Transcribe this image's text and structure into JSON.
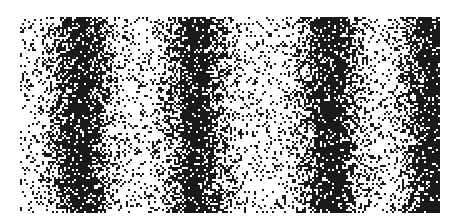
{
  "image": {
    "description": "Dithered stochastic pattern of black dots on white forming vertical dark bands",
    "width": 455,
    "height": 223,
    "background": "#ffffff",
    "dot_color": "#1a1a1a",
    "region": {
      "x0": 20,
      "y0": 17,
      "x1": 440,
      "y1": 212
    },
    "band_centers_x": [
      80,
      195,
      330,
      432
    ],
    "band_sigma": 28,
    "base_density": 0.12,
    "peak_density": 0.9,
    "dot_size": 2
  }
}
